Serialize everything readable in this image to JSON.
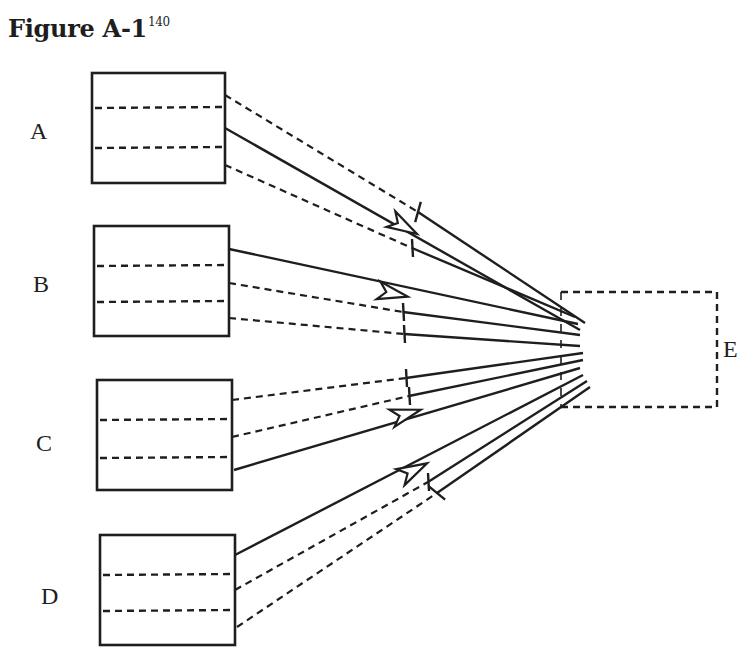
{
  "figure": {
    "title": "Figure A-1",
    "superscript": "140"
  },
  "colors": {
    "ink": "#1e1e1e",
    "background": "#ffffff"
  },
  "labels": [
    {
      "id": "A",
      "text": "A",
      "x": 30,
      "y": 118
    },
    {
      "id": "B",
      "text": "B",
      "x": 33,
      "y": 271
    },
    {
      "id": "C",
      "text": "C",
      "x": 36,
      "y": 430
    },
    {
      "id": "D",
      "text": "D",
      "x": 41,
      "y": 583
    },
    {
      "id": "E",
      "text": "E",
      "x": 723,
      "y": 336
    }
  ],
  "boxes": [
    {
      "id": "A",
      "x1": 92,
      "y1": 73,
      "x2": 225,
      "y2": 183,
      "dividers": [
        108,
        148
      ]
    },
    {
      "id": "B",
      "x1": 94,
      "y1": 226,
      "x2": 229,
      "y2": 336,
      "dividers": [
        266,
        302
      ]
    },
    {
      "id": "C",
      "x1": 97,
      "y1": 380,
      "x2": 232,
      "y2": 490,
      "dividers": [
        420,
        458
      ]
    },
    {
      "id": "D",
      "x1": 100,
      "y1": 535,
      "x2": 235,
      "y2": 645,
      "dividers": [
        575,
        611
      ]
    }
  ],
  "target_box": {
    "id": "E",
    "x1": 561,
    "y1": 292,
    "x2": 717,
    "y2": 407,
    "style": "dashed"
  },
  "connections": [
    {
      "from": "A",
      "type": "dashed-to-solid",
      "start": [
        225,
        95
      ],
      "mid": [
        418,
        212
      ],
      "end": [
        585,
        323
      ],
      "marker": "cross"
    },
    {
      "from": "A",
      "type": "solid-arrow",
      "start": [
        225,
        128
      ],
      "mid": [
        410,
        230
      ],
      "end": [
        580,
        330
      ],
      "marker": "arrow"
    },
    {
      "from": "A",
      "type": "dashed-to-solid",
      "start": [
        225,
        165
      ],
      "mid": [
        412,
        248
      ],
      "end": [
        575,
        317
      ],
      "marker": "tick"
    },
    {
      "from": "B",
      "type": "solid-arrow",
      "start": [
        229,
        249
      ],
      "mid": [
        400,
        295
      ],
      "end": [
        578,
        324
      ],
      "marker": "arrow"
    },
    {
      "from": "B",
      "type": "dashed-to-solid",
      "start": [
        229,
        283
      ],
      "mid": [
        403,
        312
      ],
      "end": [
        580,
        335
      ],
      "marker": "tick"
    },
    {
      "from": "B",
      "type": "dashed-to-solid",
      "start": [
        229,
        318
      ],
      "mid": [
        404,
        334
      ],
      "end": [
        580,
        346
      ],
      "marker": "tick"
    },
    {
      "from": "C",
      "type": "dashed-to-solid",
      "start": [
        232,
        400
      ],
      "mid": [
        406,
        378
      ],
      "end": [
        583,
        353
      ],
      "marker": "tick"
    },
    {
      "from": "C",
      "type": "dashed-to-solid",
      "start": [
        232,
        437
      ],
      "mid": [
        409,
        396
      ],
      "end": [
        583,
        360
      ],
      "marker": "tick"
    },
    {
      "from": "C",
      "type": "solid-arrow",
      "start": [
        234,
        470
      ],
      "mid": [
        413,
        412
      ],
      "end": [
        580,
        368
      ],
      "marker": "arrow"
    },
    {
      "from": "D",
      "type": "solid-arrow",
      "start": [
        235,
        555
      ],
      "mid": [
        420,
        467
      ],
      "end": [
        583,
        375
      ],
      "marker": "arrow"
    },
    {
      "from": "D",
      "type": "dashed-to-solid",
      "start": [
        235,
        590
      ],
      "mid": [
        428,
        482
      ],
      "end": [
        587,
        381
      ],
      "marker": "tick"
    },
    {
      "from": "D",
      "type": "dashed-to-solid",
      "start": [
        237,
        627
      ],
      "mid": [
        437,
        493
      ],
      "end": [
        590,
        387
      ],
      "marker": "cross"
    }
  ]
}
